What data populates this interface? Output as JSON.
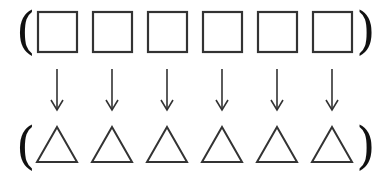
{
  "diagram": {
    "top_row": {
      "open_bracket": "(",
      "close_bracket": ")",
      "items": [
        {
          "shape": "square",
          "x": 38
        },
        {
          "shape": "square",
          "x": 93
        },
        {
          "shape": "square",
          "x": 148
        },
        {
          "shape": "square",
          "x": 203
        },
        {
          "shape": "square",
          "x": 258
        },
        {
          "shape": "square",
          "x": 313
        }
      ]
    },
    "arrows": [
      {
        "direction": "down",
        "x": 57
      },
      {
        "direction": "down",
        "x": 112
      },
      {
        "direction": "down",
        "x": 167
      },
      {
        "direction": "down",
        "x": 222
      },
      {
        "direction": "down",
        "x": 277
      },
      {
        "direction": "down",
        "x": 332
      }
    ],
    "bottom_row": {
      "open_bracket": "(",
      "close_bracket": ")",
      "items": [
        {
          "shape": "triangle",
          "x": 57
        },
        {
          "shape": "triangle",
          "x": 112
        },
        {
          "shape": "triangle",
          "x": 167
        },
        {
          "shape": "triangle",
          "x": 222
        },
        {
          "shape": "triangle",
          "x": 277
        },
        {
          "shape": "triangle",
          "x": 332
        }
      ]
    },
    "colors": {
      "stroke": "#333333",
      "bracket": "#111111",
      "background": "#ffffff"
    }
  }
}
